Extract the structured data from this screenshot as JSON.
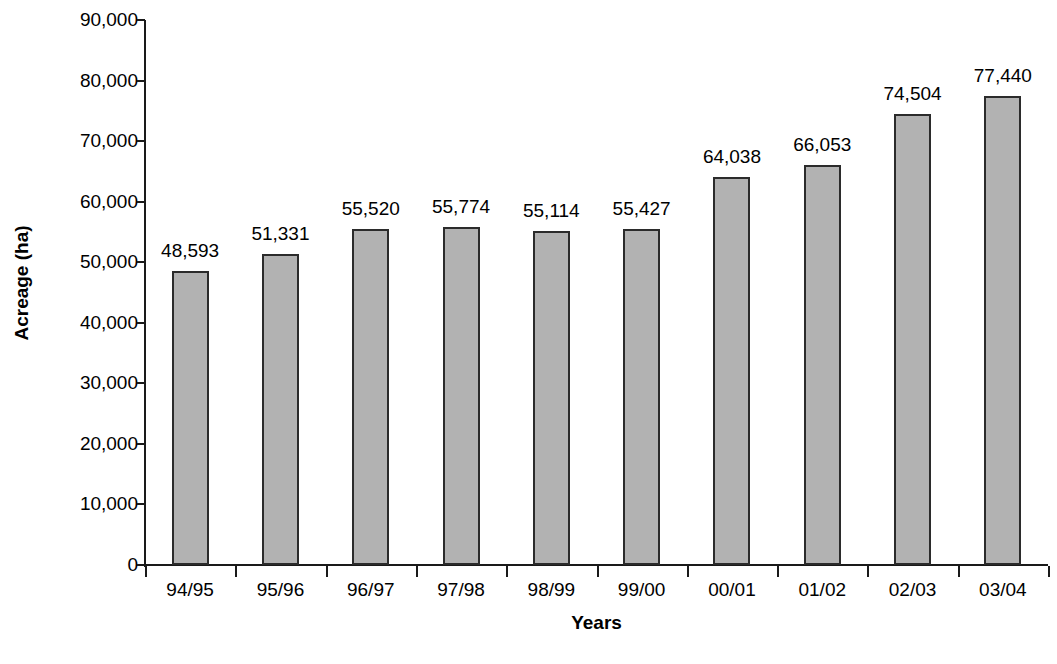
{
  "chart_data": {
    "type": "bar",
    "title": "",
    "xlabel": "Years",
    "ylabel": "Acreage (ha)",
    "categories": [
      "94/95",
      "95/96",
      "96/97",
      "97/98",
      "98/99",
      "99/00",
      "00/01",
      "01/02",
      "02/03",
      "03/04"
    ],
    "values": [
      48593,
      51331,
      55520,
      55774,
      55114,
      55427,
      64038,
      66053,
      74504,
      77440
    ],
    "value_labels": [
      "48,593",
      "51,331",
      "55,520",
      "55,774",
      "55,114",
      "55,427",
      "64,038",
      "66,053",
      "74,504",
      "77,440"
    ],
    "ylim": [
      0,
      90000
    ],
    "ytick_values": [
      0,
      10000,
      20000,
      30000,
      40000,
      50000,
      60000,
      70000,
      80000,
      90000
    ],
    "ytick_labels": [
      "0",
      "10,000",
      "20,000",
      "30,000",
      "40,000",
      "50,000",
      "60,000",
      "70,000",
      "80,000",
      "90,000"
    ],
    "grid": false,
    "legend": false,
    "bar_color": "#b2b2b2",
    "bar_border_color": "#2b2b2b",
    "axis_color": "#1a1a1a",
    "data_labels_shown": true
  }
}
